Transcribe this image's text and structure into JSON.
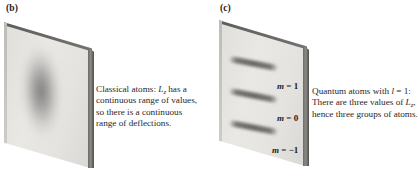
{
  "figure": {
    "panels": [
      {
        "id": "b",
        "label": "(b)",
        "caption_lines": [
          "Classical atoms: L",
          "z",
          " has a continuous range of values, so there is a continuous range of deflections."
        ],
        "caption_plain": "Classical atoms: Lz has a continuous range of values, so there is a continuous range of deflections.",
        "pattern": "continuous-smear"
      },
      {
        "id": "c",
        "label": "(c)",
        "caption_plain": "Quantum atoms with l = 1: There are three values of Lz, hence three groups of atoms.",
        "pattern": "three-discrete-bands",
        "band_labels": [
          {
            "symbol": "m",
            "equals": " = ",
            "value": "1"
          },
          {
            "symbol": "m",
            "equals": " = ",
            "value": "0"
          },
          {
            "symbol": "m",
            "equals": " = ",
            "value": "−1"
          }
        ]
      }
    ],
    "caption_b": {
      "prefix": "Classical atoms: ",
      "symbol": "L",
      "subscript": "z",
      "rest": " has a continuous range of values, so there is a continuous range of deflections."
    },
    "caption_c": {
      "line1": "Quantum atoms with ",
      "symbol_l": "l",
      "eq1": " = 1: There are three values of ",
      "symbol_L": "L",
      "subscript": "z",
      "rest": ", hence three groups of atoms."
    },
    "colors": {
      "background": "#ffffff",
      "plate_face": "#e6e5e2",
      "plate_edge": "#5e5d5b",
      "band": "#605f5d",
      "text": "#2a2827"
    }
  }
}
